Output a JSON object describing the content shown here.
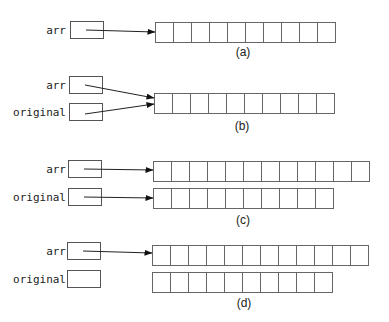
{
  "panels": [
    {
      "id": "a",
      "caption": "(a)",
      "variables": [
        {
          "name": "arr",
          "label_x": 2,
          "label_y": 25,
          "box_x": 70,
          "box_y": 21
        }
      ],
      "arrays": [
        {
          "x": 155,
          "y": 22,
          "cells": 10
        }
      ],
      "pointers": [
        {
          "from": "arr",
          "x1": 86,
          "y1": 30,
          "x2": 155,
          "y2": 32
        }
      ],
      "caption_x": 228,
      "caption_y": 45
    },
    {
      "id": "b",
      "caption": "(b)",
      "variables": [
        {
          "name": "arr",
          "label_x": 2,
          "label_y": 80,
          "box_x": 69,
          "box_y": 76
        },
        {
          "name": "original",
          "label_x": 2,
          "label_y": 107,
          "box_x": 69,
          "box_y": 103
        }
      ],
      "arrays": [
        {
          "x": 154,
          "y": 93,
          "cells": 10
        }
      ],
      "pointers": [
        {
          "from": "arr",
          "x1": 85,
          "y1": 85,
          "x2": 154,
          "y2": 98
        },
        {
          "from": "original",
          "x1": 85,
          "y1": 114,
          "x2": 154,
          "y2": 104
        }
      ],
      "caption_x": 227,
      "caption_y": 119
    },
    {
      "id": "c",
      "caption": "(c)",
      "variables": [
        {
          "name": "arr",
          "label_x": 2,
          "label_y": 164,
          "box_x": 68,
          "box_y": 160
        },
        {
          "name": "original",
          "label_x": 2,
          "label_y": 192,
          "box_x": 68,
          "box_y": 188
        }
      ],
      "arrays": [
        {
          "x": 153,
          "y": 161,
          "cells": 12
        },
        {
          "x": 153,
          "y": 188,
          "cells": 10
        }
      ],
      "pointers": [
        {
          "from": "arr",
          "x1": 84,
          "y1": 169,
          "x2": 153,
          "y2": 170
        },
        {
          "from": "original",
          "x1": 84,
          "y1": 197,
          "x2": 153,
          "y2": 198
        }
      ],
      "caption_x": 228,
      "caption_y": 213
    },
    {
      "id": "d",
      "caption": "(d)",
      "variables": [
        {
          "name": "arr",
          "label_x": 2,
          "label_y": 246,
          "box_x": 67,
          "box_y": 242
        },
        {
          "name": "original",
          "label_x": 2,
          "label_y": 274,
          "box_x": 67,
          "box_y": 270
        }
      ],
      "arrays": [
        {
          "x": 152,
          "y": 245,
          "cells": 12
        },
        {
          "x": 152,
          "y": 272,
          "cells": 10
        }
      ],
      "pointers": [
        {
          "from": "arr",
          "x1": 83,
          "y1": 251,
          "x2": 152,
          "y2": 253
        }
      ],
      "caption_x": 229,
      "caption_y": 296
    }
  ],
  "colors": {
    "stroke": "#555555",
    "text": "#222222",
    "background": "#ffffff"
  }
}
